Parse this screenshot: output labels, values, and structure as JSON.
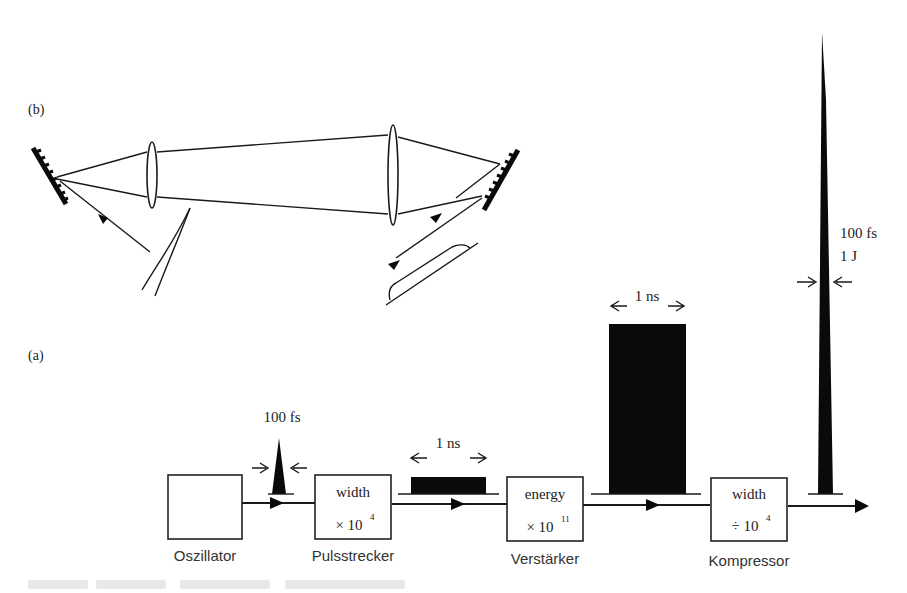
{
  "figure": {
    "panel_b": {
      "label": "(b)",
      "description": "Grating pulse stretcher/compressor optics: two gratings, two lenses, input and output beams"
    },
    "panel_a": {
      "label": "(a)",
      "description": "Chirped pulse amplification chain"
    },
    "stages": [
      {
        "name": "Oszillator",
        "line1": "",
        "line2": ""
      },
      {
        "name": "Pulsstrecker",
        "line1": "width",
        "line2": "× 10",
        "exp": "4"
      },
      {
        "name": "Verstärker",
        "line1": "energy",
        "line2": "× 10",
        "exp": "11"
      },
      {
        "name": "Kompressor",
        "line1": "width",
        "line2": "÷ 10",
        "exp": "4"
      }
    ],
    "pulses": [
      {
        "id": "oscillator-output",
        "label": "100 fs"
      },
      {
        "id": "stretched",
        "label": "1 ns"
      },
      {
        "id": "amplified",
        "label": "1 ns"
      },
      {
        "id": "compressed",
        "label_line1": "100 fs",
        "label_line2": "1 J"
      }
    ],
    "colors": {
      "ink": "#0a0a0a",
      "background": "#ffffff",
      "text": "#222222"
    }
  }
}
